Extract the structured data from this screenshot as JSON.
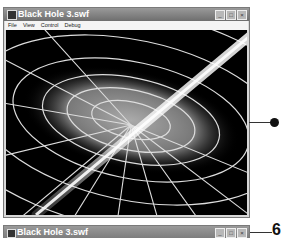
{
  "window_top": {
    "title": "Black Hole 3.swf",
    "menu": [
      "File",
      "View",
      "Control",
      "Debug"
    ],
    "controls": [
      "minimize",
      "maximize",
      "close"
    ],
    "control_glyphs": [
      "_",
      "□",
      "×"
    ],
    "content": "black hole accretion disk with warped spacetime grid and bright relativistic jet"
  },
  "window_bottom": {
    "title": "Black Hole 3.swf",
    "control_glyphs": [
      "_",
      "□",
      "×"
    ]
  },
  "callouts": [
    {
      "label": "callout-dot-1"
    },
    {
      "label": "6"
    }
  ]
}
